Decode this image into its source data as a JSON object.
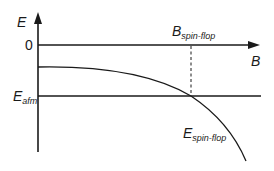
{
  "diagram": {
    "y_axis_label": "E",
    "x_axis_label": "B",
    "zero_label": "0",
    "afm_label_main": "E",
    "afm_label_sub": "afm",
    "spinflop_field_main": "B",
    "spinflop_field_sub": "spin-flop",
    "spinflop_energy_main": "E",
    "spinflop_energy_sub": "spin-flop",
    "colors": {
      "line": "#1a1a1a",
      "background": "#ffffff"
    }
  }
}
